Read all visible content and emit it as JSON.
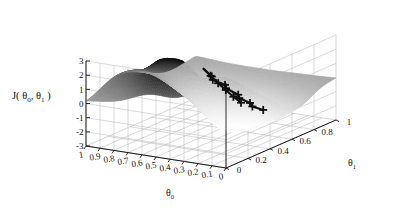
{
  "figure": {
    "type": "surface-plot-3d",
    "background_color": "#ffffff",
    "axis_color": "#1a1a1a",
    "grid_color": "#b8b8b8",
    "path_color": "#101010"
  },
  "zaxis": {
    "label_main": "J",
    "label_open": "( ",
    "label_theta0": "θ",
    "label_sub0": "0",
    "label_comma": ", ",
    "label_theta1": "θ",
    "label_sub1": "1",
    "label_close": " )",
    "ticks": [
      "3",
      "2",
      "1",
      "0",
      "-1",
      "-2",
      "-3"
    ],
    "range": [
      -3,
      3
    ]
  },
  "xaxis": {
    "name_theta": "θ",
    "name_sub": "0",
    "ticks": [
      "1",
      "0.9",
      "0.8",
      "0.7",
      "0.6",
      "0.5",
      "0.4",
      "0.3",
      "0.2",
      "0.1",
      "0"
    ],
    "range": [
      0,
      1
    ]
  },
  "yaxis": {
    "name_theta": "θ",
    "name_sub": "1",
    "ticks": [
      "0",
      "0.2",
      "0.4",
      "0.6",
      "0.8",
      "1"
    ],
    "range": [
      0,
      1
    ]
  },
  "chart_data": {
    "type": "surface",
    "title": "",
    "xlabel": "θ₀",
    "ylabel": "θ₁",
    "zlabel": "J(θ₀, θ₁)",
    "xlim": [
      0,
      1
    ],
    "ylim": [
      0,
      1
    ],
    "zlim": [
      -3,
      3
    ],
    "xticks": [
      1,
      0.9,
      0.8,
      0.7,
      0.6,
      0.5,
      0.4,
      0.3,
      0.2,
      0.1,
      0
    ],
    "yticks": [
      0,
      0.2,
      0.4,
      0.6,
      0.8,
      1
    ],
    "zticks": [
      3,
      2,
      1,
      0,
      -1,
      -2,
      -3
    ],
    "grid": true,
    "legend": "none",
    "colormap": "grayscale",
    "surface_description": "Non-convex wavy cost surface with two tall peaks (back-left ridge and back-right dome), a deep valley running front-center, and gentle ripples at the left and right edges; resembles the MATLAB peaks function.",
    "annotations": [
      {
        "name": "gradient-descent-path-a",
        "description": "Zig-zagging descent path with plus markers running from the central peak down and toward the front-left valley",
        "marker": "plus",
        "points": [
          {
            "theta0": 0.4,
            "theta1": 0.3,
            "J": 2.4
          },
          {
            "theta0": 0.4,
            "theta1": 0.38,
            "J": 1.55
          },
          {
            "theta0": 0.44,
            "theta1": 0.44,
            "J": 1.05
          },
          {
            "theta0": 0.4,
            "theta1": 0.5,
            "J": 0.55
          },
          {
            "theta0": 0.44,
            "theta1": 0.56,
            "J": 0.05
          },
          {
            "theta0": 0.4,
            "theta1": 0.62,
            "J": -0.55
          },
          {
            "theta0": 0.44,
            "theta1": 0.68,
            "J": -1.05
          },
          {
            "theta0": 0.41,
            "theta1": 0.74,
            "J": -1.55
          },
          {
            "theta0": 0.44,
            "theta1": 0.8,
            "J": -2.05
          },
          {
            "theta0": 0.41,
            "theta1": 0.86,
            "J": -2.45
          }
        ]
      },
      {
        "name": "gradient-descent-path-b",
        "description": "Straighter descent path with plus markers running from the central peak toward the right edge",
        "marker": "plus",
        "points": [
          {
            "theta0": 0.4,
            "theta1": 0.3,
            "J": 2.4
          },
          {
            "theta0": 0.33,
            "theta1": 0.28,
            "J": 2.05
          },
          {
            "theta0": 0.26,
            "theta1": 0.26,
            "J": 1.7
          },
          {
            "theta0": 0.19,
            "theta1": 0.24,
            "J": 1.4
          },
          {
            "theta0": 0.12,
            "theta1": 0.22,
            "J": 1.1
          },
          {
            "theta0": 0.05,
            "theta1": 0.2,
            "J": 0.85
          }
        ]
      }
    ]
  }
}
